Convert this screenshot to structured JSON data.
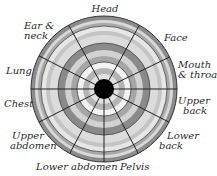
{
  "diagram": {
    "type": "radial-body-region-wheel",
    "center": {
      "x": 104,
      "y": 89
    },
    "outer_radius": 73,
    "center_disc_radius": 10,
    "ring_bands": [
      {
        "r": 73,
        "color": "#8c8c8c"
      },
      {
        "r": 69,
        "color": "#d8d8d8"
      },
      {
        "r": 66,
        "color": "#a8a8a8"
      },
      {
        "r": 63,
        "color": "#e6e6e6"
      },
      {
        "r": 58,
        "color": "#c4c4c4"
      },
      {
        "r": 54,
        "color": "#dcdcdc"
      },
      {
        "r": 46,
        "color": "#8a8a8a"
      },
      {
        "r": 39,
        "color": "#d2d2d2"
      },
      {
        "r": 33,
        "color": "#a6a6a6"
      },
      {
        "r": 27,
        "color": "#f2f2f2"
      },
      {
        "r": 21,
        "color": "#b4b4b4"
      },
      {
        "r": 15,
        "color": "#e0e0e0"
      }
    ],
    "center_color": "#000000",
    "spoke_color": "#222222",
    "spoke_angles_deg": [
      0,
      26,
      61,
      119,
      153,
      180,
      207,
      242,
      270,
      298,
      333
    ],
    "labels": [
      {
        "text": "Head"
      },
      {
        "text": "Face"
      },
      {
        "text": "Mouth",
        "text2": "& throat"
      },
      {
        "text": "Upper",
        "text2": "back"
      },
      {
        "text": "Lower",
        "text2": "back"
      },
      {
        "text": "Pelvis"
      },
      {
        "text": "Lower abdomen"
      },
      {
        "text": "Upper",
        "text2": "abdomen"
      },
      {
        "text": "Chest"
      },
      {
        "text": "Lung"
      },
      {
        "text": "Ear &",
        "text2": "neck"
      }
    ]
  }
}
